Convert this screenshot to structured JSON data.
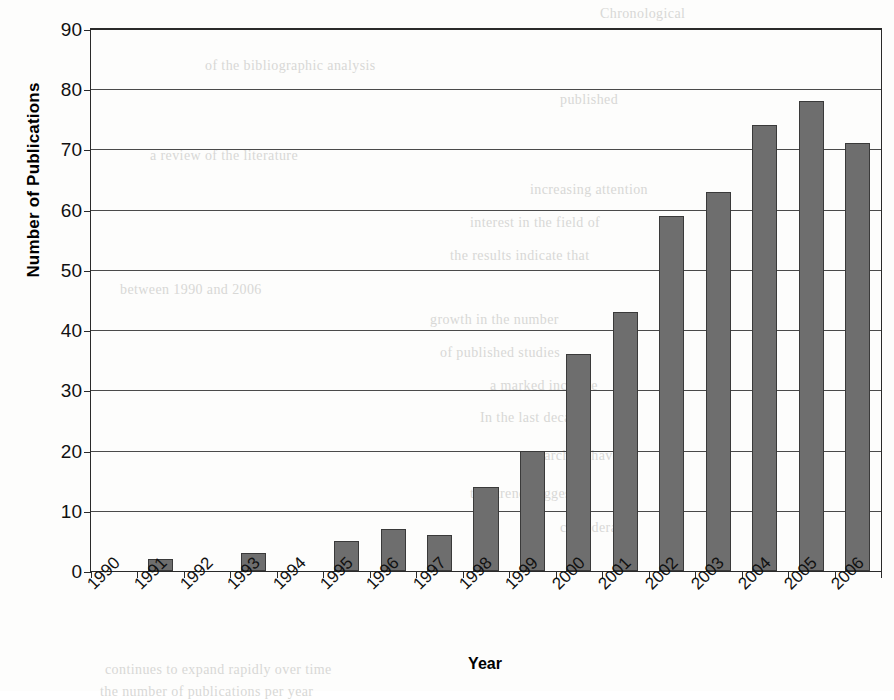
{
  "chart_data": {
    "type": "bar",
    "title": "",
    "xlabel": "Year",
    "ylabel": "Number of Publications",
    "categories": [
      "1990",
      "1991",
      "1992",
      "1993",
      "1994",
      "1995",
      "1996",
      "1997",
      "1998",
      "1999",
      "2000",
      "2001",
      "2002",
      "2003",
      "2004",
      "2005",
      "2006"
    ],
    "values": [
      0,
      2,
      0,
      3,
      0,
      5,
      7,
      6,
      14,
      20,
      36,
      43,
      59,
      63,
      74,
      78,
      71
    ],
    "ylim": [
      0,
      90
    ],
    "yticks": [
      0,
      10,
      20,
      30,
      40,
      50,
      60,
      70,
      80,
      90
    ],
    "ytick_labels": [
      "0",
      "10",
      "20",
      "30",
      "40",
      "50",
      "60",
      "70",
      "80",
      "90"
    ],
    "grid": true,
    "legend": "none",
    "series": [
      {
        "name": "Number of Publications",
        "values": [
          0,
          2,
          0,
          3,
          0,
          5,
          7,
          6,
          14,
          20,
          36,
          43,
          59,
          63,
          74,
          78,
          71
        ]
      }
    ],
    "bar_color": "#6e6e6e",
    "bar_edge_color": "#3a3a3a",
    "axis_color": "#2a2a2a",
    "background_color": "#ffffff",
    "xtick_rotation": -45
  },
  "page_background": {
    "ghost_lines": [
      {
        "text": "Chronological",
        "x": 600,
        "y": 6
      },
      {
        "text": "of the bibliographic analysis",
        "x": 205,
        "y": 58
      },
      {
        "text": "published",
        "x": 560,
        "y": 92
      },
      {
        "text": "a review of the literature",
        "x": 150,
        "y": 148
      },
      {
        "text": "increasing attention",
        "x": 530,
        "y": 182
      },
      {
        "text": "interest in the field of",
        "x": 470,
        "y": 215
      },
      {
        "text": "the results indicate that",
        "x": 450,
        "y": 248
      },
      {
        "text": "between 1990 and 2006",
        "x": 120,
        "y": 282
      },
      {
        "text": "growth in the number",
        "x": 430,
        "y": 312
      },
      {
        "text": "of published studies",
        "x": 440,
        "y": 345
      },
      {
        "text": "a marked increase",
        "x": 490,
        "y": 378
      },
      {
        "text": "In the last decade",
        "x": 480,
        "y": 410
      },
      {
        "text": "researchers have",
        "x": 520,
        "y": 448
      },
      {
        "text": "this trend suggests",
        "x": 470,
        "y": 486
      },
      {
        "text": "considerable",
        "x": 560,
        "y": 520
      },
      {
        "text": "continues to expand rapidly over time",
        "x": 105,
        "y": 662
      },
      {
        "text": "the number of publications per year",
        "x": 100,
        "y": 684
      }
    ]
  }
}
